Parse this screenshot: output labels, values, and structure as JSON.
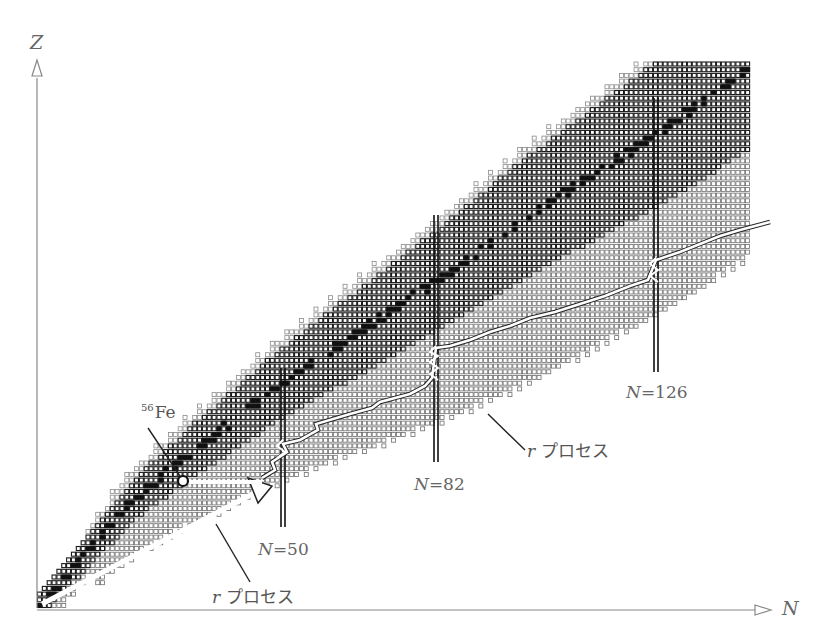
{
  "chart_data": {
    "type": "diagram",
    "title": "",
    "x_axis": {
      "label": "N"
    },
    "y_axis": {
      "label": "Z"
    },
    "grid": {
      "origin_px": [
        40,
        608
      ],
      "cell_px": 6.1,
      "n_max": 122,
      "z_max": 98
    },
    "band": {
      "comment": "for each N column: stable-valley center Z, half-width of dark (known) region, extent of light (predicted) region below",
      "points": [
        {
          "n": 0,
          "stable_z": 0
        },
        {
          "n": 20,
          "stable_z": 19
        },
        {
          "n": 30,
          "stable_z": 26
        },
        {
          "n": 50,
          "stable_z": 39
        },
        {
          "n": 82,
          "stable_z": 57
        },
        {
          "n": 100,
          "stable_z": 68
        },
        {
          "n": 126,
          "stable_z": 82
        },
        {
          "n": 146,
          "stable_z": 94
        }
      ]
    },
    "magic_numbers": [
      {
        "n": 50,
        "label_n": "N",
        "label_eq": "=50"
      },
      {
        "n": 82,
        "label_n": "N",
        "label_eq": "=82"
      },
      {
        "n": 126,
        "label_n": "N",
        "label_eq": "=126"
      }
    ],
    "annotations": [
      {
        "id": "fe56",
        "mass": "56",
        "symbol": "Fe",
        "n": 30,
        "z": 26
      },
      {
        "id": "r1",
        "text_italic": "r",
        "text": "プロセス",
        "points_to": "lower r-process arrow"
      },
      {
        "id": "r2",
        "text_italic": "r",
        "text": "プロセス",
        "points_to": "upper r-process zigzag path"
      }
    ]
  },
  "labels": {
    "z_axis": "Z",
    "n_axis": "N",
    "fe_mass": "56",
    "fe_symbol": "Fe",
    "magic_50_n": "N",
    "magic_50_eq": "=50",
    "magic_82_n": "N",
    "magic_82_eq": "=82",
    "magic_126_n": "N",
    "magic_126_eq": "=126",
    "rprocess_1_r": "r",
    "rprocess_1_text": "プロセス",
    "rprocess_2_r": "r",
    "rprocess_2_text": "プロセス"
  },
  "colors": {
    "dark_cell": "#1a1a1a",
    "light_cell": "#9a9a9a",
    "stable": "#111111",
    "axis": "#777777",
    "background": "#ffffff"
  }
}
